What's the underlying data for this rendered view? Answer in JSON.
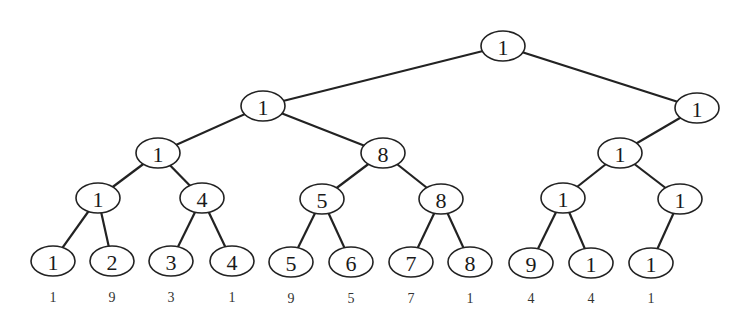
{
  "diagram": {
    "type": "binary-tree",
    "nodes": [
      {
        "id": "n0",
        "value": "1",
        "x": 503,
        "y": 46
      },
      {
        "id": "n1",
        "value": "1",
        "x": 263,
        "y": 106
      },
      {
        "id": "n2",
        "value": "1",
        "x": 697,
        "y": 108
      },
      {
        "id": "n3",
        "value": "1",
        "x": 158,
        "y": 153
      },
      {
        "id": "n4",
        "value": "8",
        "x": 383,
        "y": 153
      },
      {
        "id": "n5",
        "value": "1",
        "x": 620,
        "y": 153
      },
      {
        "id": "n6",
        "value": "1",
        "x": 98,
        "y": 198
      },
      {
        "id": "n7",
        "value": "4",
        "x": 202,
        "y": 198
      },
      {
        "id": "n8",
        "value": "5",
        "x": 322,
        "y": 199
      },
      {
        "id": "n9",
        "value": "8",
        "x": 441,
        "y": 199
      },
      {
        "id": "n10",
        "value": "1",
        "x": 563,
        "y": 198
      },
      {
        "id": "n11",
        "value": "1",
        "x": 680,
        "y": 199
      },
      {
        "id": "n12",
        "value": "1",
        "x": 53,
        "y": 261
      },
      {
        "id": "n13",
        "value": "2",
        "x": 112,
        "y": 261
      },
      {
        "id": "n14",
        "value": "3",
        "x": 171,
        "y": 261
      },
      {
        "id": "n15",
        "value": "4",
        "x": 232,
        "y": 261
      },
      {
        "id": "n16",
        "value": "5",
        "x": 291,
        "y": 262
      },
      {
        "id": "n17",
        "value": "6",
        "x": 351,
        "y": 262
      },
      {
        "id": "n18",
        "value": "7",
        "x": 411,
        "y": 262
      },
      {
        "id": "n19",
        "value": "8",
        "x": 470,
        "y": 262
      },
      {
        "id": "n20",
        "value": "9",
        "x": 531,
        "y": 263
      },
      {
        "id": "n21",
        "value": "1",
        "x": 591,
        "y": 263
      },
      {
        "id": "n22",
        "value": "1",
        "x": 651,
        "y": 263
      }
    ],
    "edges": [
      [
        "n0",
        "n1"
      ],
      [
        "n0",
        "n2"
      ],
      [
        "n1",
        "n3"
      ],
      [
        "n1",
        "n4"
      ],
      [
        "n2",
        "n5"
      ],
      [
        "n3",
        "n6"
      ],
      [
        "n3",
        "n7"
      ],
      [
        "n4",
        "n8"
      ],
      [
        "n4",
        "n9"
      ],
      [
        "n5",
        "n10"
      ],
      [
        "n5",
        "n11"
      ],
      [
        "n6",
        "n12"
      ],
      [
        "n6",
        "n13"
      ],
      [
        "n7",
        "n14"
      ],
      [
        "n7",
        "n15"
      ],
      [
        "n8",
        "n16"
      ],
      [
        "n8",
        "n17"
      ],
      [
        "n9",
        "n18"
      ],
      [
        "n9",
        "n19"
      ],
      [
        "n10",
        "n20"
      ],
      [
        "n10",
        "n21"
      ],
      [
        "n11",
        "n22"
      ]
    ],
    "leaf_labels": [
      {
        "text": "1",
        "x": 53,
        "y": 297
      },
      {
        "text": "9",
        "x": 112,
        "y": 297
      },
      {
        "text": "3",
        "x": 171,
        "y": 297
      },
      {
        "text": "1",
        "x": 232,
        "y": 297
      },
      {
        "text": "9",
        "x": 291,
        "y": 298
      },
      {
        "text": "5",
        "x": 351,
        "y": 298
      },
      {
        "text": "7",
        "x": 411,
        "y": 298
      },
      {
        "text": "1",
        "x": 470,
        "y": 298
      },
      {
        "text": "4",
        "x": 531,
        "y": 298
      },
      {
        "text": "4",
        "x": 591,
        "y": 298
      },
      {
        "text": "1",
        "x": 651,
        "y": 298
      }
    ],
    "node_rx": 22,
    "node_ry": 15
  }
}
